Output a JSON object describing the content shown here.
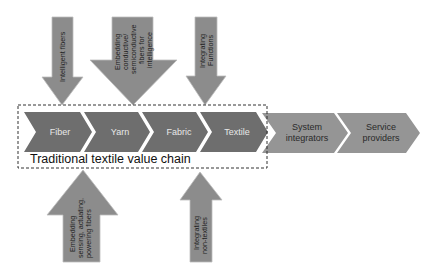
{
  "diagram": {
    "colors": {
      "chain_fill": "#6e6e6e",
      "external_fill": "#959595",
      "arrow_fill": "#8c8c8c",
      "arrow_stroke": "#bdbdbd",
      "dashed_border": "#333333"
    },
    "value_chain": {
      "title": "Traditional textile value chain",
      "stages": [
        {
          "label": "Fiber"
        },
        {
          "label": "Yarn"
        },
        {
          "label": "Fabric"
        },
        {
          "label": "Textile"
        }
      ]
    },
    "external_stages": [
      {
        "line1": "System",
        "line2": "integrators"
      },
      {
        "line1": "Service",
        "line2": "providers"
      }
    ],
    "top_arrows": [
      {
        "lines": [
          "Intelligent fibers"
        ],
        "target": "Fiber"
      },
      {
        "lines": [
          "Embedding",
          "conductive/",
          "semiconductive",
          "fibers for",
          "intelligence"
        ],
        "target": "Yarn"
      },
      {
        "lines": [
          "Integrating",
          "Functions"
        ],
        "target": "Textile"
      }
    ],
    "bottom_arrows": [
      {
        "lines": [
          "Embedding",
          "sensing, actuating,",
          "powering fibers"
        ],
        "target": "Yarn"
      },
      {
        "lines": [
          "Integrating",
          "non-textiles"
        ],
        "target": "Textile"
      }
    ]
  }
}
